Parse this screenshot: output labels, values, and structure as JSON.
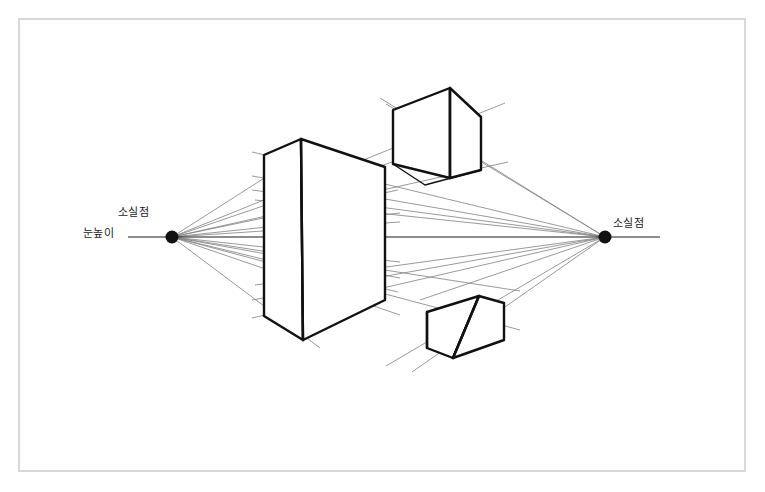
{
  "diagram": {
    "background_color": "#ffffff",
    "frame_color": "#d8d8d8",
    "line_color": "#1a1a1a",
    "guide_color": "#7a7a7a",
    "labels": {
      "left_vanishing_point": "소실점",
      "eye_level": "눈높이",
      "right_vanishing_point": "소실점"
    },
    "vanishing_points": {
      "left": {
        "x": 172,
        "y": 237,
        "radius": 6.5
      },
      "right": {
        "x": 605,
        "y": 237,
        "radius": 6.5
      }
    },
    "horizon_line": {
      "x1": 128,
      "y1": 237,
      "x2": 660,
      "y2": 237
    },
    "boxes": [
      {
        "name": "center-box",
        "front_top": {
          "x": 301,
          "y": 139
        },
        "front_bottom": {
          "x": 303,
          "y": 340
        },
        "left_top": {
          "x": 264,
          "y": 155
        },
        "left_bottom": {
          "x": 264,
          "y": 316
        },
        "right_top": {
          "x": 385,
          "y": 167
        },
        "right_bottom": {
          "x": 385,
          "y": 300
        }
      },
      {
        "name": "top-box",
        "front_top": {
          "x": 450,
          "y": 88
        },
        "front_bottom": {
          "x": 450,
          "y": 178
        },
        "left_top": {
          "x": 393,
          "y": 110
        },
        "left_bottom": {
          "x": 393,
          "y": 164
        },
        "right_top": {
          "x": 481,
          "y": 117
        },
        "right_bottom": {
          "x": 481,
          "y": 170
        },
        "back_top": {
          "x": 425,
          "y": 137
        }
      },
      {
        "name": "bottom-box",
        "front_top": {
          "x": 479,
          "y": 296
        },
        "front_bottom": {
          "x": 453,
          "y": 358
        },
        "left_top": {
          "x": 427,
          "y": 312
        },
        "left_bottom": {
          "x": 427,
          "y": 348
        },
        "right_top": {
          "x": 504,
          "y": 303
        },
        "right_bottom": {
          "x": 504,
          "y": 340
        }
      }
    ]
  }
}
